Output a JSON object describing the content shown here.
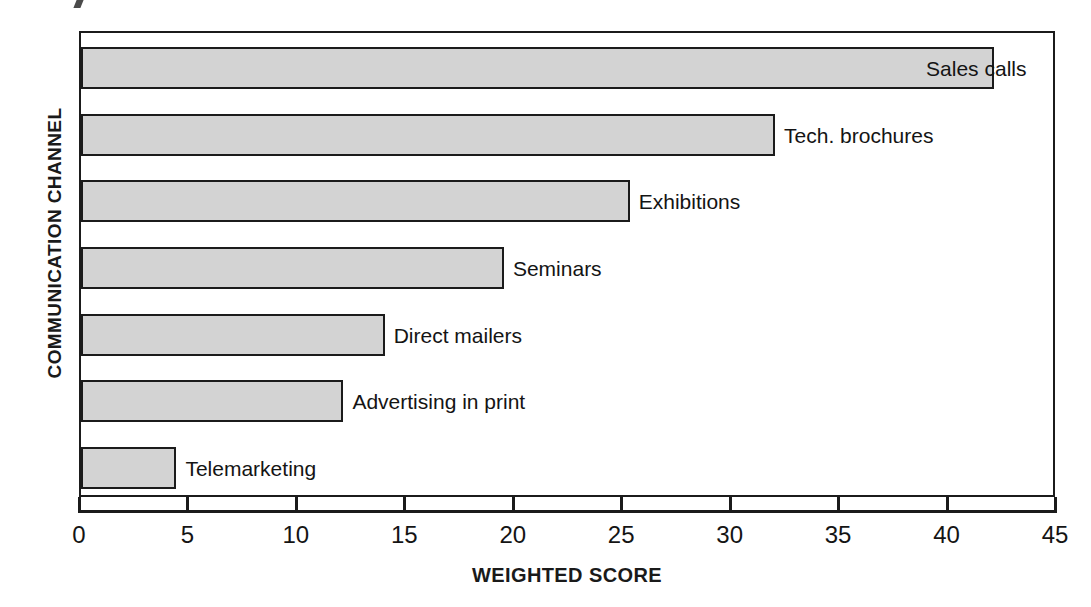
{
  "chart_data": {
    "type": "bar",
    "orientation": "horizontal",
    "title": "",
    "xlabel": "WEIGHTED SCORE",
    "ylabel": "COMMUNICATION CHANNEL",
    "categories": [
      "Sales calls",
      "Tech. brochures",
      "Exhibitions",
      "Seminars",
      "Direct mailers",
      "Advertising in print",
      "Telemarketing"
    ],
    "values": [
      42.1,
      32.0,
      25.3,
      19.5,
      14.0,
      12.1,
      4.4
    ],
    "xlim": [
      0,
      45
    ],
    "xticks": [
      0,
      5,
      10,
      15,
      20,
      25,
      30,
      35,
      40,
      45
    ],
    "xtick_labels": [
      "0",
      "5",
      "10",
      "15",
      "20",
      "25",
      "30",
      "35",
      "40",
      "45"
    ],
    "grid": false,
    "legend": "none",
    "bar_fill_color": "#d3d3d3",
    "bar_border_color": "#1b1b1b",
    "axis_color": "#1b1b1b",
    "label_overlap_note": "Sales calls label overlaps the end of its bar"
  }
}
